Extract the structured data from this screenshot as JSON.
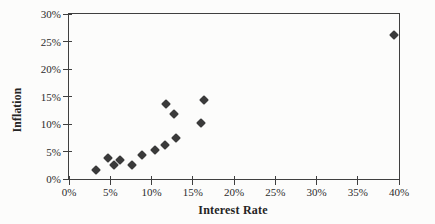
{
  "figure": {
    "background": "#fcfcfb",
    "line_color": "#3f3f3f",
    "text_color": "#2b2b2b"
  },
  "chart_data": {
    "type": "scatter",
    "title": "",
    "xlabel": "Interest Rate",
    "ylabel": "Inflation",
    "xlim": [
      0,
      40
    ],
    "ylim": [
      0,
      30
    ],
    "grid": false,
    "legend": "none",
    "x_ticks": [
      {
        "value": 0,
        "label": "0%"
      },
      {
        "value": 5,
        "label": "5%"
      },
      {
        "value": 10,
        "label": "10%"
      },
      {
        "value": 15,
        "label": "15%"
      },
      {
        "value": 20,
        "label": "20%"
      },
      {
        "value": 25,
        "label": "25%"
      },
      {
        "value": 30,
        "label": "30%"
      },
      {
        "value": 35,
        "label": "35%"
      },
      {
        "value": 40,
        "label": "40%"
      }
    ],
    "y_ticks": [
      {
        "value": 0,
        "label": "0%"
      },
      {
        "value": 5,
        "label": "5%"
      },
      {
        "value": 10,
        "label": "10%"
      },
      {
        "value": 15,
        "label": "15%"
      },
      {
        "value": 20,
        "label": "20%"
      },
      {
        "value": 25,
        "label": "25%"
      },
      {
        "value": 30,
        "label": "30%"
      }
    ],
    "marker": {
      "shape": "diamond",
      "color": "#3a3a3a",
      "size": 7
    },
    "points": [
      {
        "x": 3.3,
        "y": 1.7
      },
      {
        "x": 4.7,
        "y": 3.9
      },
      {
        "x": 5.5,
        "y": 2.5
      },
      {
        "x": 6.2,
        "y": 3.5
      },
      {
        "x": 7.6,
        "y": 2.5
      },
      {
        "x": 8.9,
        "y": 4.4
      },
      {
        "x": 10.4,
        "y": 5.2
      },
      {
        "x": 11.6,
        "y": 6.2
      },
      {
        "x": 13.0,
        "y": 7.5
      },
      {
        "x": 11.7,
        "y": 13.6
      },
      {
        "x": 12.7,
        "y": 11.8
      },
      {
        "x": 16.0,
        "y": 10.2
      },
      {
        "x": 16.4,
        "y": 14.4
      },
      {
        "x": 39.4,
        "y": 26.2
      }
    ]
  }
}
